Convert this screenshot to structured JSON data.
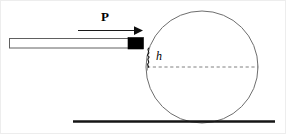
{
  "figure": {
    "kind": "physics-diagram",
    "width": 286,
    "height": 134,
    "background_color": "#ffffff",
    "border_color": "#e8e8e8"
  },
  "labels": {
    "force": "P",
    "height": "h"
  },
  "colors": {
    "stroke": "#3a3a3a",
    "ball_outline": "#6b6b6b",
    "stick_outline": "#555555",
    "stick_fill": "#ffffff",
    "stick_tip": "#000000",
    "ground": "#1a1a1a",
    "dashed": "#7a7a7a",
    "arrow": "#1a1a1a",
    "brace": "#1a1a1a"
  },
  "geometry": {
    "ball": {
      "cx": 202,
      "cy": 67,
      "r": 56
    },
    "ground_line": {
      "x1": 73,
      "x2": 275,
      "y": 121.5
    },
    "center_dashed_line": {
      "x1": 147,
      "x2": 258,
      "y": 67
    },
    "stick": {
      "x": 9,
      "y": 38,
      "width": 119,
      "height": 10
    },
    "stick_tip": {
      "x": 128,
      "y": 37.5,
      "width": 15,
      "height": 11
    },
    "force_arrow": {
      "x1": 78,
      "x2": 141,
      "y": 30
    },
    "brace": {
      "x": 147,
      "y_top": 48,
      "y_bottom": 67
    }
  },
  "icons": {
    "force_arrow": "arrow-right-icon",
    "brace": "curly-brace-icon"
  }
}
